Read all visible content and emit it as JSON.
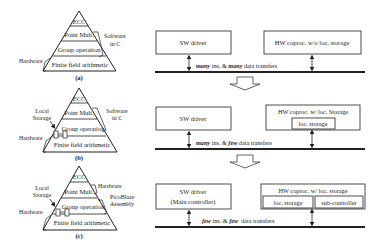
{
  "panels": [
    {
      "caption": "(a)",
      "pyramid": {
        "levels": [
          "ECC",
          "Point Mult.",
          "Group operation",
          "Finite field arithmetic"
        ]
      },
      "labels": {
        "right_top_1": "Software",
        "right_top_2": "in C",
        "left_bottom": "Hardware"
      },
      "system": {
        "sw_box": "SW driver",
        "hw_box": "HW coproc. w/o loc. storage",
        "bus_label_em1": "many",
        "bus_label_mid": " ins. & ",
        "bus_label_em2": "many",
        "bus_label_end": " data transfers"
      }
    },
    {
      "caption": "(b)",
      "pyramid": {
        "levels": [
          "ECC",
          "Point Mult.",
          "Group operation",
          "Finite field arithmetic"
        ]
      },
      "labels": {
        "right_top_1": "Software",
        "right_top_2": "in C",
        "left_mid_1": "Local",
        "left_mid_2": "Storage",
        "left_bottom": "Hardware"
      },
      "system": {
        "sw_box": "SW driver",
        "hw_box": "HW coproc. w/ loc. Storage",
        "hw_sub_1": "loc. storage",
        "bus_label_em1": "many",
        "bus_label_mid": " ins. & ",
        "bus_label_em2": "few",
        "bus_label_end": " data transfers"
      }
    },
    {
      "caption": "(c)",
      "pyramid": {
        "levels": [
          "ECC",
          "Point Mult.",
          "Group operation",
          "Finite field arithmetic"
        ]
      },
      "labels": {
        "right_top_1": "Hardware",
        "right_mid_1": "PicoBlaze",
        "right_mid_2": "Assembly",
        "left_mid_1": "Local",
        "left_mid_2": "Storage",
        "left_bottom": "Hardware"
      },
      "system": {
        "sw_box_1": "SW driver",
        "sw_box_2": "(Main controller)",
        "hw_box": "HW coproc. w/ loc. storage",
        "hw_sub_1": "loc. storage",
        "hw_sub_2": "sub-controller",
        "bus_label_em1": "few",
        "bus_label_mid": " ins. & ",
        "bus_label_em2": "few",
        "bus_label_end": "  data transfers"
      }
    }
  ],
  "colors": {
    "line": "#222222",
    "background": "#ffffff"
  }
}
